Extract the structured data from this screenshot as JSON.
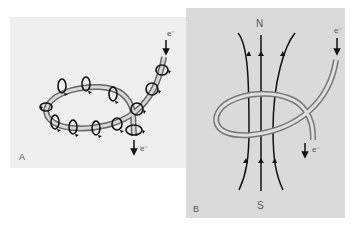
{
  "figure": {
    "panel_a": {
      "label": "A",
      "electron_in": "e⁻",
      "electron_out": "e⁻",
      "background": "#efefef"
    },
    "panel_b": {
      "label": "B",
      "north_pole": "N",
      "south_pole": "S",
      "electron_in": "e⁻",
      "electron_out": "e⁻",
      "background": "#dadada"
    }
  }
}
